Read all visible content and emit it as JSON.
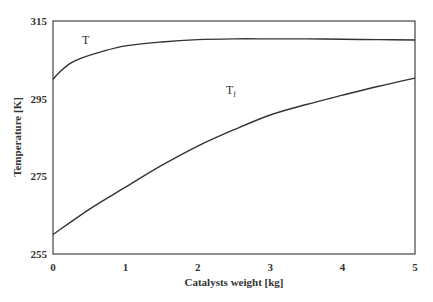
{
  "chart_data": {
    "type": "line",
    "title": "",
    "xlabel": "Catalysts weight [kg]",
    "ylabel": "Temperature [K]",
    "xlim": [
      0,
      5
    ],
    "ylim": [
      255,
      315
    ],
    "xticks": [
      0,
      1,
      2,
      3,
      4,
      5
    ],
    "yticks": [
      255,
      275,
      295,
      315
    ],
    "xtick_labels": [
      "0",
      "1",
      "2",
      "3",
      "4",
      "5"
    ],
    "ytick_labels": [
      "255",
      "275",
      "295",
      "315"
    ],
    "grid": false,
    "legend": "none (inline curve labels)",
    "series": [
      {
        "name": "T",
        "label": "T",
        "x": [
          0,
          0.1,
          0.25,
          0.4,
          0.65,
          1.0,
          1.5,
          2.0,
          2.5,
          3.0,
          3.5,
          4.0,
          4.5,
          5.0
        ],
        "values": [
          300.0,
          302.0,
          304.2,
          305.5,
          307.0,
          308.6,
          309.6,
          310.2,
          310.4,
          310.4,
          310.4,
          310.3,
          310.2,
          310.1
        ]
      },
      {
        "name": "Tf",
        "label": "T",
        "label_subscript": "f",
        "x": [
          0,
          0.5,
          1.0,
          1.5,
          2.0,
          2.5,
          3.0,
          3.5,
          4.0,
          4.5,
          5.0
        ],
        "values": [
          260.0,
          266.5,
          272.2,
          277.8,
          282.8,
          287.0,
          290.8,
          293.5,
          295.9,
          298.2,
          300.3
        ]
      }
    ],
    "annotations": [
      {
        "text": "T",
        "series": "T",
        "x": 0.45,
        "y": 311.5
      },
      {
        "text": "Tf",
        "series": "Tf",
        "x": 2.4,
        "y": 291.0
      }
    ]
  },
  "labels": {
    "xlabel": "Catalysts weight [kg]",
    "ylabel": "Temperature [K]",
    "t_label": "T",
    "tf_label_main": "T",
    "tf_label_sub": "f"
  }
}
